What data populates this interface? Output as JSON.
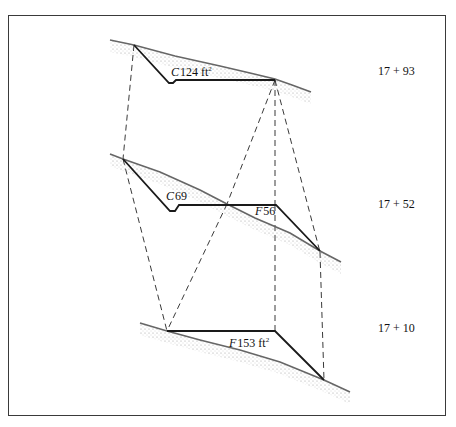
{
  "diagram": {
    "type": "earthwork-cross-sections",
    "colors": {
      "line": "#1a1a1a",
      "ground_stipple": "#8a8a8a",
      "frame": "#3a3a3a"
    },
    "sections": [
      {
        "station": "17 + 93",
        "area_type": "C",
        "area_value": "124 ft",
        "area_unit_sup": "2",
        "ground": [
          [
            110,
            40
          ],
          [
            134,
            45
          ],
          [
            175,
            56
          ],
          [
            220,
            66
          ],
          [
            250,
            73
          ],
          [
            275,
            79
          ],
          [
            292,
            85
          ],
          [
            311,
            92
          ]
        ],
        "template": [
          [
            134,
            45
          ],
          [
            169,
            83
          ],
          [
            173,
            83
          ],
          [
            176,
            80
          ],
          [
            275,
            80
          ]
        ],
        "label_pos": [
          171,
          76
        ],
        "station_pos": [
          378,
          75
        ]
      },
      {
        "station": "17 + 52",
        "area_type": "C",
        "area_value": "69",
        "area_unit_sup": "",
        "fill_type": "F",
        "fill_value": "56",
        "ground": [
          [
            110,
            154
          ],
          [
            123,
            159
          ],
          [
            160,
            172
          ],
          [
            200,
            190
          ],
          [
            227,
            204
          ],
          [
            255,
            218
          ],
          [
            290,
            233
          ],
          [
            320,
            251
          ],
          [
            341,
            262
          ]
        ],
        "template": [
          [
            123,
            159
          ],
          [
            170,
            211
          ],
          [
            175,
            211
          ],
          [
            179,
            205
          ],
          [
            276,
            205
          ],
          [
            320,
            251
          ]
        ],
        "label_pos": [
          166,
          200
        ],
        "fill_label_pos": [
          255,
          215
        ],
        "station_pos": [
          378,
          208
        ]
      },
      {
        "station": "17 + 10",
        "area_type": "F",
        "area_value": "153 ft",
        "area_unit_sup": "2",
        "ground": [
          [
            140,
            323
          ],
          [
            167,
            331
          ],
          [
            200,
            340
          ],
          [
            240,
            350
          ],
          [
            280,
            362
          ],
          [
            324,
            380
          ],
          [
            350,
            392
          ]
        ],
        "template": [
          [
            167,
            331
          ],
          [
            275,
            331
          ],
          [
            324,
            380
          ]
        ],
        "label_pos": [
          229,
          347
        ],
        "station_pos": [
          378,
          332
        ]
      }
    ],
    "dashed_connectors": [
      [
        [
          134,
          45
        ],
        [
          123,
          159
        ]
      ],
      [
        [
          275,
          80
        ],
        [
          227,
          204
        ]
      ],
      [
        [
          275,
          80
        ],
        [
          275,
          205
        ]
      ],
      [
        [
          275,
          80
        ],
        [
          320,
          252
        ]
      ],
      [
        [
          123,
          159
        ],
        [
          167,
          331
        ]
      ],
      [
        [
          227,
          204
        ],
        [
          167,
          331
        ]
      ],
      [
        [
          275,
          205
        ],
        [
          275,
          331
        ]
      ],
      [
        [
          320,
          252
        ],
        [
          324,
          380
        ]
      ]
    ]
  }
}
